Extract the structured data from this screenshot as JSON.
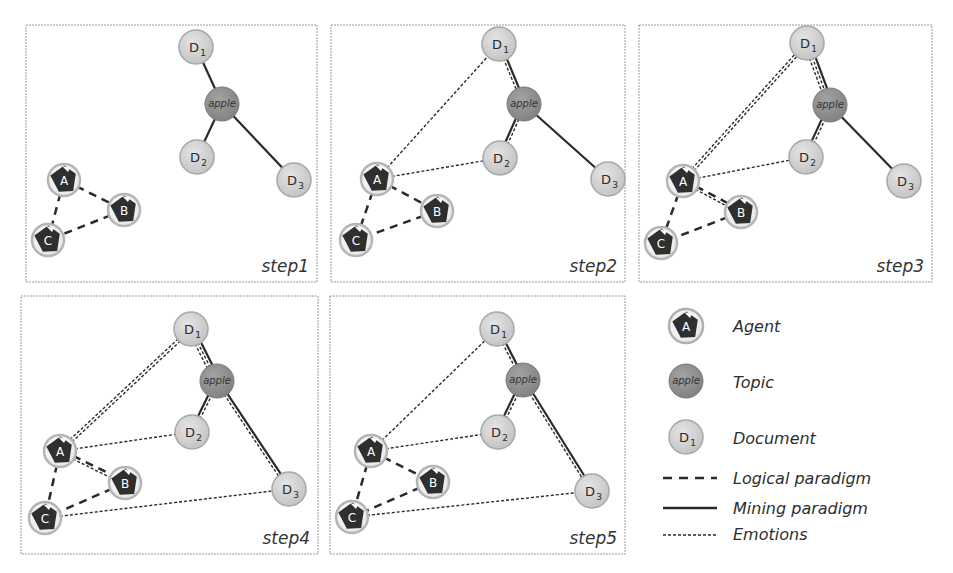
{
  "colors": {
    "panel_border": "#9a9a9a",
    "document_fill": "#cfcfcf",
    "document_stroke": "#a8a8a8",
    "topic_fill": "#8f8f8f",
    "topic_stroke": "#7a7a7a",
    "agent_ring": "#b5b5b5",
    "agent_shape": "#2f2f2f",
    "edge": "#2a2a2a"
  },
  "nodes": {
    "agents": [
      {
        "id": "A",
        "label": "A"
      },
      {
        "id": "B",
        "label": "B"
      },
      {
        "id": "C",
        "label": "C"
      }
    ],
    "topic": {
      "id": "apple",
      "label": "apple"
    },
    "documents": [
      {
        "id": "D1",
        "label": "D",
        "sub": "1"
      },
      {
        "id": "D2",
        "label": "D",
        "sub": "2"
      },
      {
        "id": "D3",
        "label": "D",
        "sub": "3"
      }
    ]
  },
  "panels": [
    {
      "label": "step1",
      "edges": [
        {
          "from": "A",
          "to": "B",
          "types": [
            "logical"
          ]
        },
        {
          "from": "A",
          "to": "C",
          "types": [
            "logical"
          ]
        },
        {
          "from": "B",
          "to": "C",
          "types": [
            "logical"
          ]
        },
        {
          "from": "D1",
          "to": "apple",
          "types": [
            "mining"
          ]
        },
        {
          "from": "D2",
          "to": "apple",
          "types": [
            "mining"
          ]
        },
        {
          "from": "apple",
          "to": "D3",
          "types": [
            "mining"
          ]
        }
      ]
    },
    {
      "label": "step2",
      "edges": [
        {
          "from": "A",
          "to": "B",
          "types": [
            "logical"
          ]
        },
        {
          "from": "A",
          "to": "C",
          "types": [
            "logical"
          ]
        },
        {
          "from": "B",
          "to": "C",
          "types": [
            "logical"
          ]
        },
        {
          "from": "A",
          "to": "D1",
          "types": [
            "emotions"
          ]
        },
        {
          "from": "A",
          "to": "D2",
          "types": [
            "emotions"
          ]
        },
        {
          "from": "D1",
          "to": "apple",
          "types": [
            "mining",
            "emotions"
          ]
        },
        {
          "from": "D2",
          "to": "apple",
          "types": [
            "mining",
            "emotions"
          ]
        },
        {
          "from": "apple",
          "to": "D3",
          "types": [
            "mining"
          ]
        }
      ]
    },
    {
      "label": "step3",
      "edges": [
        {
          "from": "A",
          "to": "B",
          "types": [
            "logical",
            "emotions"
          ]
        },
        {
          "from": "A",
          "to": "C",
          "types": [
            "logical"
          ]
        },
        {
          "from": "B",
          "to": "C",
          "types": [
            "logical"
          ]
        },
        {
          "from": "A",
          "to": "D1",
          "types": [
            "emotions",
            "emotions"
          ]
        },
        {
          "from": "A",
          "to": "D2",
          "types": [
            "emotions"
          ]
        },
        {
          "from": "D1",
          "to": "apple",
          "types": [
            "mining",
            "emotions",
            "emotions"
          ]
        },
        {
          "from": "D2",
          "to": "apple",
          "types": [
            "mining",
            "emotions"
          ]
        },
        {
          "from": "apple",
          "to": "D3",
          "types": [
            "mining"
          ]
        }
      ]
    },
    {
      "label": "step4",
      "edges": [
        {
          "from": "A",
          "to": "B",
          "types": [
            "logical",
            "emotions"
          ]
        },
        {
          "from": "A",
          "to": "C",
          "types": [
            "logical"
          ]
        },
        {
          "from": "B",
          "to": "C",
          "types": [
            "logical"
          ]
        },
        {
          "from": "A",
          "to": "D1",
          "types": [
            "emotions",
            "emotions"
          ]
        },
        {
          "from": "A",
          "to": "D2",
          "types": [
            "emotions"
          ]
        },
        {
          "from": "C",
          "to": "D3",
          "types": [
            "emotions"
          ]
        },
        {
          "from": "D1",
          "to": "apple",
          "types": [
            "mining",
            "emotions",
            "emotions"
          ]
        },
        {
          "from": "D2",
          "to": "apple",
          "types": [
            "mining",
            "emotions"
          ]
        },
        {
          "from": "apple",
          "to": "D3",
          "types": [
            "mining",
            "emotions"
          ]
        }
      ]
    },
    {
      "label": "step5",
      "edges": [
        {
          "from": "A",
          "to": "B",
          "types": [
            "logical"
          ]
        },
        {
          "from": "A",
          "to": "C",
          "types": [
            "logical"
          ]
        },
        {
          "from": "B",
          "to": "C",
          "types": [
            "logical"
          ]
        },
        {
          "from": "A",
          "to": "D1",
          "types": [
            "emotions"
          ]
        },
        {
          "from": "A",
          "to": "D2",
          "types": [
            "emotions"
          ]
        },
        {
          "from": "C",
          "to": "D3",
          "types": [
            "emotions"
          ]
        },
        {
          "from": "D1",
          "to": "apple",
          "types": [
            "mining",
            "emotions"
          ]
        },
        {
          "from": "D2",
          "to": "apple",
          "types": [
            "mining",
            "emotions"
          ]
        },
        {
          "from": "apple",
          "to": "D3",
          "types": [
            "mining",
            "emotions"
          ]
        }
      ]
    }
  ],
  "legend": {
    "agent": {
      "icon_label": "A",
      "text": "Agent"
    },
    "topic": {
      "icon_label": "apple",
      "text": "Topic"
    },
    "document": {
      "icon_label": "D",
      "icon_sub": "1",
      "text": "Document"
    },
    "logical": {
      "text": "Logical paradigm"
    },
    "mining": {
      "text": "Mining paradigm"
    },
    "emotions": {
      "text": "Emotions"
    }
  }
}
